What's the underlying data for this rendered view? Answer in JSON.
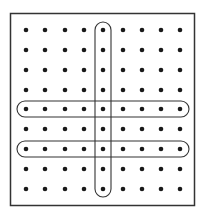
{
  "diagram": {
    "grid": {
      "rows": 9,
      "cols": 9,
      "x_positions": [
        26,
        45,
        65,
        84,
        103,
        123,
        142,
        161,
        180
      ],
      "y_positions": [
        30,
        50,
        70,
        90,
        109,
        129,
        149,
        169,
        189
      ],
      "dot_radius": 2.3,
      "dot_color": "#1a1a1a"
    },
    "frame": {
      "x": 10.5,
      "y": 13.5,
      "width": 184,
      "height": 192,
      "stroke": "#333333"
    },
    "highlights": [
      {
        "type": "column",
        "index": 4,
        "label": "highlighted-column-5"
      },
      {
        "type": "row",
        "index": 4,
        "label": "highlighted-row-5"
      },
      {
        "type": "row",
        "index": 6,
        "label": "highlighted-row-7"
      }
    ]
  }
}
